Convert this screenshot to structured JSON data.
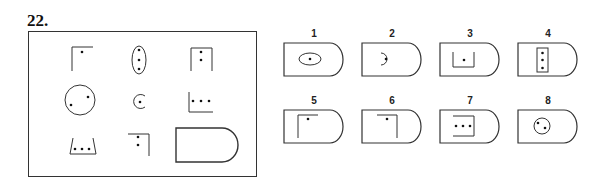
{
  "question": {
    "number": "22."
  },
  "matrix": {
    "cells": [
      {
        "row": 1,
        "col": 1,
        "shape": "open-square-top-left",
        "dots": 1
      },
      {
        "row": 1,
        "col": 2,
        "shape": "vertical-ellipse",
        "dots": 3
      },
      {
        "row": 1,
        "col": 3,
        "shape": "open-square-bottom",
        "dots": 2
      },
      {
        "row": 2,
        "col": 1,
        "shape": "circle",
        "dots": 2
      },
      {
        "row": 2,
        "col": 2,
        "shape": "open-circle",
        "dots": 1
      },
      {
        "row": 2,
        "col": 3,
        "shape": "open-square-bottom-left",
        "dots": 3
      },
      {
        "row": 3,
        "col": 1,
        "shape": "trapezoid-open-top",
        "dots": 3
      },
      {
        "row": 3,
        "col": 2,
        "shape": "open-square-top-right",
        "dots": 2
      },
      {
        "row": 3,
        "col": 3,
        "shape": "missing-d-shape",
        "dots": 0
      }
    ]
  },
  "options": [
    {
      "label": "1",
      "inner": "horizontal-ellipse",
      "dots": 1
    },
    {
      "label": "2",
      "inner": "open-circle",
      "dots": 1
    },
    {
      "label": "3",
      "inner": "open-square-top",
      "dots": 1
    },
    {
      "label": "4",
      "inner": "vertical-rectangle",
      "dots": 3
    },
    {
      "label": "5",
      "inner": "open-square-top-left",
      "dots": 1
    },
    {
      "label": "6",
      "inner": "open-square-top-right",
      "dots": 1
    },
    {
      "label": "7",
      "inner": "open-square-right",
      "dots": 3
    },
    {
      "label": "8",
      "inner": "circle",
      "dots": 2
    }
  ]
}
